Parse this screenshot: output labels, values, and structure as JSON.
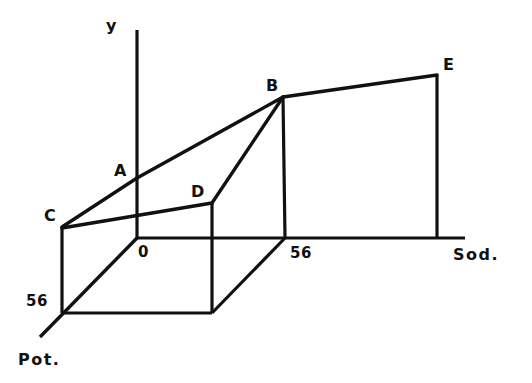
{
  "figure": {
    "caption": "",
    "background_color": "#ffffff",
    "line_color": "#111111",
    "axes": [
      {
        "id": "y",
        "label": "y",
        "kind": "vertical"
      },
      {
        "id": "sod",
        "label": "Sod.",
        "kind": "horizontal"
      },
      {
        "id": "pot",
        "label": "Pot.",
        "kind": "depth"
      }
    ],
    "origin_label": "0",
    "ticks": [
      {
        "id": "sod-56",
        "axis": "sod",
        "label": "56",
        "value": 56
      },
      {
        "id": "pot-56",
        "axis": "pot",
        "label": "56",
        "value": 56
      }
    ],
    "vertices": [
      {
        "id": "A",
        "label": "A"
      },
      {
        "id": "B",
        "label": "B"
      },
      {
        "id": "C",
        "label": "C"
      },
      {
        "id": "D",
        "label": "D"
      },
      {
        "id": "E",
        "label": "E"
      }
    ]
  },
  "chart_data": {
    "type": "line",
    "title": "",
    "subtitle": "",
    "xlabel": "Sod.",
    "ylabel": "y",
    "zlabel": "Pot.",
    "projection": "3d-axonometric",
    "grid": false,
    "legend": false,
    "axis_ticks": {
      "sod": [
        "0",
        "56"
      ],
      "pot": [
        "0",
        "56"
      ],
      "y": []
    },
    "annotations": [
      "y",
      "Sod.",
      "Pot.",
      "0",
      "56",
      "56",
      "A",
      "B",
      "C",
      "D",
      "E"
    ],
    "points": [
      {
        "name": "A",
        "sod": 0,
        "pot": 0,
        "note": "response on y-axis at front origin edge"
      },
      {
        "name": "B",
        "sod": 56,
        "pot": 0,
        "note": "response at high sodium, low potassium"
      },
      {
        "name": "C",
        "sod": 0,
        "pot": 56,
        "note": "response at low sodium, high potassium"
      },
      {
        "name": "D",
        "sod": 56,
        "pot": 56,
        "note": "response at high sodium, high potassium"
      },
      {
        "name": "E",
        "sod": 112,
        "pot": 0,
        "note": "extended response beyond 56 sodium"
      }
    ],
    "edges": [
      [
        "C",
        "A"
      ],
      [
        "A",
        "B"
      ],
      [
        "B",
        "E"
      ],
      [
        "C",
        "D"
      ],
      [
        "D",
        "B"
      ]
    ],
    "drop_lines": [
      "C",
      "D",
      "B",
      "E"
    ]
  },
  "geometry": {
    "origin": {
      "x": 137,
      "y": 238
    },
    "y_axis_top": {
      "x": 137,
      "y": 30
    },
    "sod_axis_end": {
      "x": 465,
      "y": 238
    },
    "pot_axis_end": {
      "x": 40,
      "y": 337
    },
    "pot_56": {
      "x": 62,
      "y": 313
    },
    "sod_56": {
      "x": 285,
      "y": 238
    },
    "base_back_right": {
      "x": 212,
      "y": 313
    },
    "A": {
      "x": 137,
      "y": 178
    },
    "B": {
      "x": 283,
      "y": 97
    },
    "C": {
      "x": 62,
      "y": 227
    },
    "D": {
      "x": 212,
      "y": 203
    },
    "E": {
      "x": 437,
      "y": 75
    }
  },
  "label_positions": {
    "y": {
      "left": 106,
      "top": 18
    },
    "A": {
      "left": 114,
      "top": 163
    },
    "B": {
      "left": 266,
      "top": 78
    },
    "C": {
      "left": 44,
      "top": 208
    },
    "D": {
      "left": 191,
      "top": 184
    },
    "E": {
      "left": 443,
      "top": 57
    },
    "origin": {
      "left": 138,
      "top": 245
    },
    "sod_56": {
      "left": 290,
      "top": 246
    },
    "pot_56": {
      "left": 26,
      "top": 294
    },
    "sod": {
      "left": 453,
      "top": 247
    },
    "pot": {
      "left": 18,
      "top": 352
    }
  }
}
